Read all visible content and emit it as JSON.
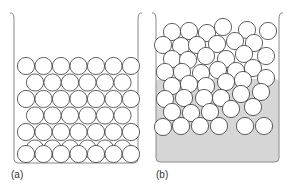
{
  "figure": {
    "panels": [
      {
        "id": "a",
        "label": "(a)",
        "description": "Regularly packed spheres (ordered solid)",
        "container": {
          "left": 14,
          "right": 138,
          "top": 13,
          "bottom": 163,
          "fill": null
        },
        "circle_radius": 8.6,
        "circles": [
          [
            26,
            66
          ],
          [
            43.5,
            66
          ],
          [
            61,
            66
          ],
          [
            78.5,
            66
          ],
          [
            96,
            66
          ],
          [
            113.5,
            66
          ],
          [
            131,
            66
          ],
          [
            35,
            82.5
          ],
          [
            52.5,
            82.5
          ],
          [
            70,
            82.5
          ],
          [
            87.5,
            82.5
          ],
          [
            105,
            82.5
          ],
          [
            122.5,
            82.5
          ],
          [
            26,
            99
          ],
          [
            43.5,
            99
          ],
          [
            61,
            99
          ],
          [
            78.5,
            99
          ],
          [
            96,
            99
          ],
          [
            113.5,
            99
          ],
          [
            131,
            99
          ],
          [
            35,
            115.5
          ],
          [
            52.5,
            115.5
          ],
          [
            70,
            115.5
          ],
          [
            87.5,
            115.5
          ],
          [
            105,
            115.5
          ],
          [
            122.5,
            115.5
          ],
          [
            26,
            132
          ],
          [
            43.5,
            132
          ],
          [
            61,
            132
          ],
          [
            78.5,
            132
          ],
          [
            96,
            132
          ],
          [
            113.5,
            132
          ],
          [
            131,
            132
          ],
          [
            35,
            148.5
          ],
          [
            52.5,
            148.5
          ],
          [
            70,
            148.5
          ],
          [
            87.5,
            148.5
          ],
          [
            105,
            148.5
          ],
          [
            122.5,
            148.5
          ],
          [
            26,
            154
          ],
          [
            43.5,
            154
          ],
          [
            61,
            154
          ],
          [
            78.5,
            154
          ],
          [
            96,
            154
          ],
          [
            113.5,
            154
          ],
          [
            131,
            154
          ]
        ]
      },
      {
        "id": "b",
        "label": "(b)",
        "description": "Randomly packed spheres (liquid) with shaded fill",
        "container": {
          "left": 156,
          "right": 279,
          "top": 13,
          "bottom": 162,
          "fill": "#d4d4d4",
          "fill_top": 79
        },
        "circle_radius": 8.6,
        "circles": [
          [
            172,
            32
          ],
          [
            189,
            31
          ],
          [
            207,
            33
          ],
          [
            223,
            27
          ],
          [
            247,
            30
          ],
          [
            268,
            31
          ],
          [
            163,
            45
          ],
          [
            181,
            46
          ],
          [
            197,
            45
          ],
          [
            217,
            44
          ],
          [
            235,
            41
          ],
          [
            254,
            43
          ],
          [
            172,
            59
          ],
          [
            188,
            60
          ],
          [
            206,
            56
          ],
          [
            226,
            59
          ],
          [
            244,
            54
          ],
          [
            266,
            56
          ],
          [
            165,
            72
          ],
          [
            182,
            72
          ],
          [
            201,
            73
          ],
          [
            218,
            70
          ],
          [
            236,
            71
          ],
          [
            253,
            68
          ],
          [
            172,
            86
          ],
          [
            189,
            84
          ],
          [
            206,
            86
          ],
          [
            226,
            82
          ],
          [
            243,
            80
          ],
          [
            266,
            78
          ],
          [
            165,
            99
          ],
          [
            184,
            98
          ],
          [
            204,
            98
          ],
          [
            221,
            98
          ],
          [
            241,
            94
          ],
          [
            261,
            92
          ],
          [
            172,
            112
          ],
          [
            191,
            113
          ],
          [
            210,
            112
          ],
          [
            231,
            109
          ],
          [
            253,
            107
          ],
          [
            163,
            127
          ],
          [
            181,
            126
          ],
          [
            200,
            126
          ],
          [
            219,
            126
          ],
          [
            245,
            126
          ],
          [
            264,
            126
          ]
        ]
      }
    ],
    "colors": {
      "stroke": "#3a3a3a",
      "wall": "#8a8a8a",
      "fill": "#d6d6d6",
      "label": "#333333"
    }
  }
}
